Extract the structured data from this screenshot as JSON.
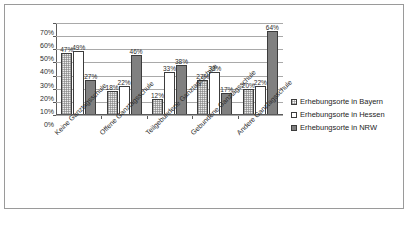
{
  "chart_data": {
    "type": "bar",
    "title": "",
    "xlabel": "",
    "ylabel": "",
    "ylim": [
      0,
      70
    ],
    "y_tick_labels": [
      "70%",
      "60%",
      "50%",
      "40%",
      "30%",
      "20%",
      "10%",
      "0%"
    ],
    "y_tick_values": [
      70,
      60,
      50,
      40,
      30,
      20,
      10,
      0
    ],
    "grid": true,
    "legend_position": "right",
    "categories": [
      "Keine Ganztagsschule",
      "Offene Ganztagsschule",
      "Teilgebundene Ganztagsschule",
      "Gebundene Ganztagsschule",
      "Andere Ganztagsschule"
    ],
    "series": [
      {
        "name": "Erhebungsorte in Bayern",
        "color": "#ececec",
        "values": [
          47,
          18,
          12,
          27,
          20
        ],
        "labels": [
          "47%",
          "18%",
          "12%",
          "27%",
          "20%"
        ]
      },
      {
        "name": "Erhebungsorte in Hessen",
        "color": "#ffffff",
        "values": [
          49,
          22,
          33,
          33,
          22
        ],
        "labels": [
          "49%",
          "22%",
          "33%",
          "33%",
          "22%"
        ]
      },
      {
        "name": "Erhebungsorte in NRW",
        "color": "#808080",
        "values": [
          27,
          46,
          38,
          17,
          64
        ],
        "labels": [
          "27%",
          "46%",
          "38%",
          "17%",
          "64%"
        ]
      }
    ]
  },
  "legend": {
    "items": [
      {
        "label": "Erhebungsorte in Bayern"
      },
      {
        "label": "Erhebungsorte in Hessen"
      },
      {
        "label": "Erhebungsorte in NRW"
      }
    ]
  }
}
